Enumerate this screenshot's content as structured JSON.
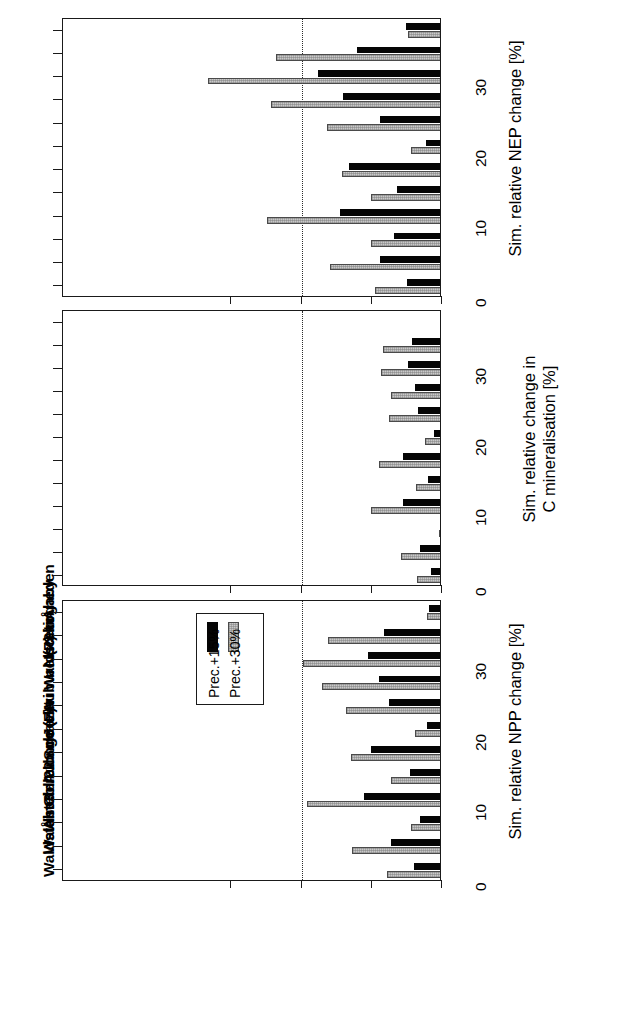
{
  "figure": {
    "orientation": "rotated-90-ccw",
    "series_colors": [
      "#050505",
      "#c9c9c9"
    ],
    "legend": {
      "entries": [
        {
          "label": "Prec.+15%",
          "color": "#050505"
        },
        {
          "label": "Prec.+30%",
          "color": "#c9c9c9"
        }
      ]
    },
    "sites": [
      "Åheden",
      "Skogaby",
      "Nacetin",
      "Waldstein",
      "Aubure (P)",
      "Jezeri",
      "Schacht",
      "Aubure (F)",
      "Collelongo",
      "Åheden 2",
      "Waldstein 2",
      "Waldstein 3"
    ]
  },
  "chart_data": [
    {
      "type": "bar",
      "panel": "top",
      "title": "",
      "xlabel": "",
      "ylabel": "Sim. relative NEP change [%]",
      "ylim": [
        0,
        35
      ],
      "yticks": [
        0,
        10,
        20,
        30
      ],
      "ytick_labels": [
        "0",
        "10",
        "20",
        "30"
      ],
      "grid": true,
      "gridlines": [
        20
      ],
      "categories": [
        "Åheden",
        "Skogaby",
        "Nacetin",
        "Waldstein",
        "Aubure (P)",
        "Jezeri",
        "Schacht",
        "Aubure (F)",
        "Collelongo",
        "Åheden 2",
        "Waldstein 2",
        "Waldstein 3"
      ],
      "series": [
        {
          "name": "Prec.+15%",
          "values": [
            5.1,
            12.1,
            17.6,
            14.1,
            8.9,
            2.3,
            13.3,
            6.4,
            14.6,
            6.8,
            8.9,
            5.0
          ]
        },
        {
          "name": "Prec.+30%",
          "values": [
            4.8,
            23.6,
            33.4,
            24.4,
            16.4,
            4.4,
            14.2,
            10.1,
            24.9,
            10.1,
            15.9,
            9.5
          ]
        }
      ]
    },
    {
      "type": "bar",
      "panel": "middle",
      "title": "",
      "xlabel": "",
      "ylabel": "Sim. relative change in\nC mineralisation [%]",
      "ylim": [
        0,
        35
      ],
      "yticks": [
        0,
        10,
        20,
        30
      ],
      "ytick_labels": [
        "0",
        "10",
        "20",
        "30"
      ],
      "grid": true,
      "gridlines": [
        20
      ],
      "categories": [
        "Åheden",
        "Skogaby",
        "Nacetin",
        "Waldstein",
        "Aubure (P)",
        "Jezeri",
        "Schacht",
        "Aubure (F)",
        "Collelongo",
        "Åheden 2",
        "Waldstein 2",
        "Waldstein 3"
      ],
      "series": [
        {
          "name": "Prec.+15%",
          "values": [
            0.0,
            4.3,
            4.8,
            3.8,
            3.4,
            1.2,
            5.6,
            2.0,
            5.5,
            0.3,
            3.1,
            1.6
          ]
        },
        {
          "name": "Prec.+30%",
          "values": [
            0.1,
            8.4,
            8.7,
            7.2,
            7.5,
            2.4,
            9.0,
            3.7,
            10.1,
            0.4,
            5.8,
            3.5
          ]
        }
      ]
    },
    {
      "type": "bar",
      "panel": "bottom",
      "title": "",
      "xlabel": "",
      "ylabel": "Sim. relative NPP change [%]",
      "ylim": [
        0,
        35
      ],
      "yticks": [
        0,
        10,
        20,
        30
      ],
      "ytick_labels": [
        "0",
        "10",
        "20",
        "30"
      ],
      "grid": true,
      "gridlines": [
        20
      ],
      "legend_position": "upper-right",
      "categories": [
        "Åheden",
        "Skogaby",
        "Nacetin",
        "Waldstein",
        "Aubure (P)",
        "Jezeri",
        "Schacht",
        "Aubure (F)",
        "Collelongo",
        "Åheden 2",
        "Waldstein 2",
        "Waldstein 3"
      ],
      "series": [
        {
          "name": "Prec.+15%",
          "values": [
            1.8,
            8.2,
            10.6,
            9.0,
            7.6,
            2.2,
            10.1,
            4.6,
            11.1,
            3.2,
            7.2,
            4.0
          ]
        },
        {
          "name": "Prec.+30%",
          "values": [
            2.2,
            16.3,
            19.8,
            17.1,
            13.7,
            3.8,
            12.9,
            7.3,
            19.3,
            4.4,
            12.8,
            7.8
          ]
        }
      ]
    }
  ]
}
